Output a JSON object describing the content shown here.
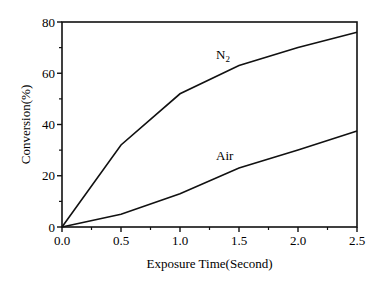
{
  "chart_data": {
    "type": "line",
    "title": "",
    "xlabel": "Exposure Time(Second)",
    "ylabel": "Conversion(%)",
    "x": [
      0.0,
      0.5,
      1.0,
      1.5,
      2.0,
      2.5
    ],
    "xlim": [
      0,
      2.5
    ],
    "ylim": [
      0,
      80
    ],
    "xticks": [
      "0.0",
      "0.5",
      "1.0",
      "1.5",
      "2.0",
      "2.5"
    ],
    "yticks": [
      "0",
      "20",
      "40",
      "60",
      "80"
    ],
    "grid": false,
    "legend": "inline labels",
    "series": [
      {
        "name": "N2",
        "label_text": "N",
        "label_sub": "2",
        "values": [
          0,
          32,
          52,
          63,
          70,
          76
        ]
      },
      {
        "name": "Air",
        "label_text": "Air",
        "values": [
          0,
          5,
          13,
          23,
          30,
          37.5
        ]
      }
    ]
  }
}
